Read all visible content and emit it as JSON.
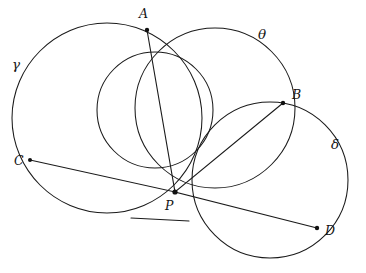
{
  "figure": {
    "kind": "hand-drawn-geometry-diagram",
    "width": 366,
    "height": 273,
    "background_color": "#ffffff",
    "ink_color": "#1a1a1a"
  },
  "points": [
    {
      "id": "A",
      "label": "A",
      "x": 147,
      "y": 30,
      "label_x": 139,
      "label_y": 8,
      "dot": true
    },
    {
      "id": "B",
      "label": "B",
      "x": 283,
      "y": 103,
      "label_x": 292,
      "label_y": 89,
      "dot": true
    },
    {
      "id": "C",
      "label": "C",
      "x": 30,
      "y": 160,
      "label_x": 14,
      "label_y": 155,
      "dot": true
    },
    {
      "id": "D",
      "label": "D",
      "x": 317,
      "y": 228,
      "label_x": 325,
      "label_y": 225,
      "dot": true
    },
    {
      "id": "P",
      "label": "P",
      "x": 175,
      "y": 192,
      "label_x": 165,
      "label_y": 200,
      "dot": true
    }
  ],
  "circles": [
    {
      "id": "gamma",
      "label": "γ",
      "cx": 107,
      "cy": 118,
      "r": 95,
      "label_x": 12,
      "label_y": 58
    },
    {
      "id": "theta",
      "label": "θ",
      "cx": 215,
      "cy": 108,
      "r": 80,
      "label_x": 258,
      "label_y": 28
    },
    {
      "id": "delta",
      "label": "δ",
      "cx": 270,
      "cy": 180,
      "r": 78,
      "label_x": 331,
      "label_y": 138
    },
    {
      "id": "middle",
      "label": "",
      "cx": 155,
      "cy": 110,
      "r": 58,
      "label_x": 0,
      "label_y": 0
    }
  ],
  "chords": [
    {
      "id": "chord-A-P-D",
      "from": "A",
      "through": "P",
      "to": "D"
    },
    {
      "id": "chord-C-P-B",
      "from": "C",
      "through": "P",
      "to": "B"
    }
  ],
  "tangent": {
    "id": "tangent-at-P",
    "through": "P",
    "x1": 131,
    "y1": 218,
    "x2": 189,
    "y2": 221
  },
  "labels": {
    "point_A": "A",
    "point_B": "B",
    "point_C": "C",
    "point_D": "D",
    "point_P": "P",
    "circle_gamma": "γ",
    "circle_theta": "θ",
    "circle_delta": "δ"
  }
}
